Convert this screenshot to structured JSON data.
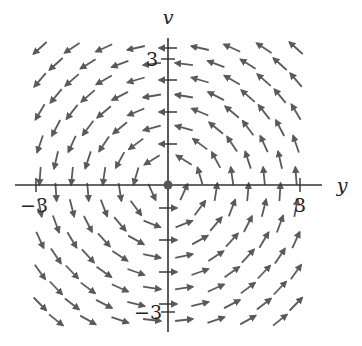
{
  "figure": {
    "type": "vector_field",
    "x_axis_label": "y",
    "y_axis_label": "v",
    "x_ticks": [
      {
        "value": -3,
        "label": "−3"
      },
      {
        "value": 3,
        "label": "3"
      }
    ],
    "y_ticks": [
      {
        "value": 3,
        "label": "3"
      },
      {
        "value": -3,
        "label": "−3"
      }
    ],
    "origin_marker": "equilibrium-point",
    "arrow_color": "#5a5a5a",
    "axis_color": "#333333",
    "x_range": [
      -3.4,
      3.4
    ],
    "y_range": [
      -3.4,
      3.4
    ]
  },
  "labels": {
    "v_axis": "v",
    "y_axis": "y",
    "tick_pos3_x": "3",
    "tick_neg3_x": "−3",
    "tick_pos3_y": "3",
    "tick_neg3_y": "−3"
  }
}
